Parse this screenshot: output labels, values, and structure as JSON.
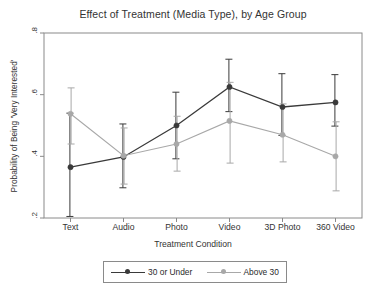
{
  "chart_data": {
    "type": "line",
    "title": "Effect of Treatment (Media Type), by Age Group",
    "xlabel": "Treatment Condition",
    "ylabel": "Probability of Being 'Very Interested'",
    "categories": [
      "Text",
      "Audio",
      "Photo",
      "Video",
      "3D Photo",
      "360 Video"
    ],
    "ylim": [
      0.2,
      0.8
    ],
    "yticks": [
      0.2,
      0.4,
      0.6,
      0.8
    ],
    "ytick_labels": [
      ".2",
      ".4",
      ".6",
      ".8"
    ],
    "grid": false,
    "legend_position": "bottom",
    "error_bars": "95% confidence interval",
    "series": [
      {
        "name": "30 or Under",
        "color": "#3a3a3a",
        "marker": "circle",
        "values": [
          0.365,
          0.398,
          0.5,
          0.625,
          0.56,
          0.575
        ],
        "ci_low": [
          0.205,
          0.298,
          0.392,
          0.545,
          0.468,
          0.498
        ],
        "ci_high": [
          0.54,
          0.505,
          0.608,
          0.715,
          0.668,
          0.665
        ]
      },
      {
        "name": "Above 30",
        "color": "#a8a8a8",
        "marker": "circle",
        "values": [
          0.538,
          0.402,
          0.44,
          0.515,
          0.47,
          0.4
        ],
        "ci_low": [
          0.44,
          0.31,
          0.352,
          0.378,
          0.382,
          0.288
        ],
        "ci_high": [
          0.622,
          0.492,
          0.53,
          0.64,
          0.57,
          0.512
        ]
      }
    ]
  },
  "legend": {
    "entries": [
      {
        "label": "30 or Under"
      },
      {
        "label": "Above 30"
      }
    ]
  }
}
